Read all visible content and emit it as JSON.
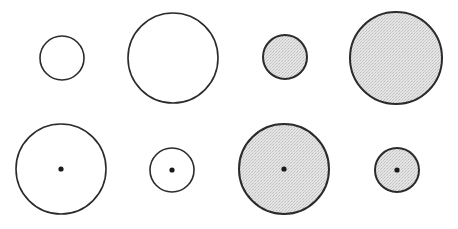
{
  "diagram": {
    "stroke_color": "#2b2b2b",
    "fill_open": "#ffffff",
    "fill_shaded": "#dcdcdc",
    "dot_color": "#1a1a1a",
    "circles": [
      {
        "id": "r1c1",
        "cx": 62,
        "cy": 58,
        "r": 22,
        "shaded": false,
        "center_dot": false
      },
      {
        "id": "r1c2",
        "cx": 173,
        "cy": 58,
        "r": 45,
        "shaded": false,
        "center_dot": false
      },
      {
        "id": "r1c3",
        "cx": 285,
        "cy": 57,
        "r": 22,
        "shaded": true,
        "center_dot": false
      },
      {
        "id": "r1c4",
        "cx": 396,
        "cy": 58,
        "r": 46,
        "shaded": true,
        "center_dot": false
      },
      {
        "id": "r2c1",
        "cx": 61,
        "cy": 169,
        "r": 45,
        "shaded": false,
        "center_dot": true
      },
      {
        "id": "r2c2",
        "cx": 172,
        "cy": 170,
        "r": 22,
        "shaded": false,
        "center_dot": true
      },
      {
        "id": "r2c3",
        "cx": 284,
        "cy": 169,
        "r": 45,
        "shaded": true,
        "center_dot": true
      },
      {
        "id": "r2c4",
        "cx": 397,
        "cy": 170,
        "r": 22,
        "shaded": true,
        "center_dot": true
      }
    ]
  }
}
